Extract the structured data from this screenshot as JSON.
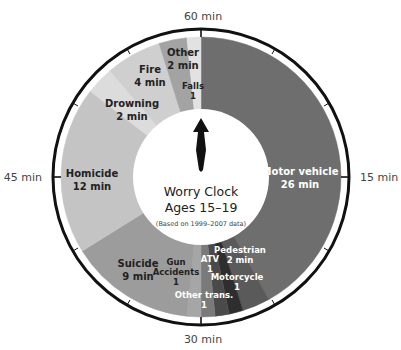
{
  "chart_data": {
    "type": "pie",
    "subtype": "donut-clock",
    "title": "Worry Clock",
    "subtitle": "Ages 15–19",
    "note": "(Based on 1999–2007 data)",
    "unit": "min",
    "clock_ticks": [
      {
        "label": "60 min",
        "minute": 0
      },
      {
        "label": "15 min",
        "minute": 15
      },
      {
        "label": "30 min",
        "minute": 30
      },
      {
        "label": "45 min",
        "minute": 45
      }
    ],
    "segments": [
      {
        "name": "Motor vehicle",
        "value": 26,
        "label_lines": [
          "Motor vehicle",
          "26 min"
        ],
        "color": "#6e6e6e",
        "text_color": "#ffffff"
      },
      {
        "name": "Pedestrian",
        "value": 2,
        "label_lines": [
          "Pedestrian",
          "2 min"
        ],
        "color": "#5a5a5a",
        "text_color": "#ffffff"
      },
      {
        "name": "Motorcycle",
        "value": 1,
        "label_lines": [
          "Motorcycle",
          "1"
        ],
        "color": "#2e2e2e",
        "text_color": "#ffffff"
      },
      {
        "name": "ATV",
        "value": 1,
        "label_lines": [
          "ATV",
          "1"
        ],
        "color": "#4a4a4a",
        "text_color": "#ffffff"
      },
      {
        "name": "Other trans.",
        "value": 1,
        "label_lines": [
          "Other trans.",
          "1"
        ],
        "color": "#7a7a7a",
        "text_color": "#ffffff"
      },
      {
        "name": "Gun Accidents",
        "value": 1,
        "label_lines": [
          "Gun",
          "Accidents",
          "1"
        ],
        "color": "#a6a6a6",
        "text_color": "#222222"
      },
      {
        "name": "Suicide",
        "value": 9,
        "label_lines": [
          "Suicide",
          "9 min"
        ],
        "color": "#9c9c9c",
        "text_color": "#222222"
      },
      {
        "name": "Homicide",
        "value": 12,
        "label_lines": [
          "Homicide",
          "12 min"
        ],
        "color": "#c4c4c4",
        "text_color": "#222222"
      },
      {
        "name": "Drowning",
        "value": 2,
        "label_lines": [
          "Drowning",
          "2 min"
        ],
        "color": "#dcdcdc",
        "text_color": "#222222"
      },
      {
        "name": "Fire",
        "value": 4,
        "label_lines": [
          "Fire",
          "4 min"
        ],
        "color": "#cfcfcf",
        "text_color": "#222222"
      },
      {
        "name": "Other",
        "value": 2,
        "label_lines": [
          "Other",
          "2 min"
        ],
        "color": "#a3a3a3",
        "text_color": "#222222"
      },
      {
        "name": "Falls",
        "value": 1,
        "label_lines": [
          "Falls",
          "1"
        ],
        "color": "#e2e2e2",
        "text_color": "#222222"
      }
    ],
    "legend": null,
    "total_value": 62
  },
  "center": {
    "title": "Worry Clock",
    "subtitle": "Ages 15–19",
    "note": "(Based on 1999–2007 data)"
  }
}
